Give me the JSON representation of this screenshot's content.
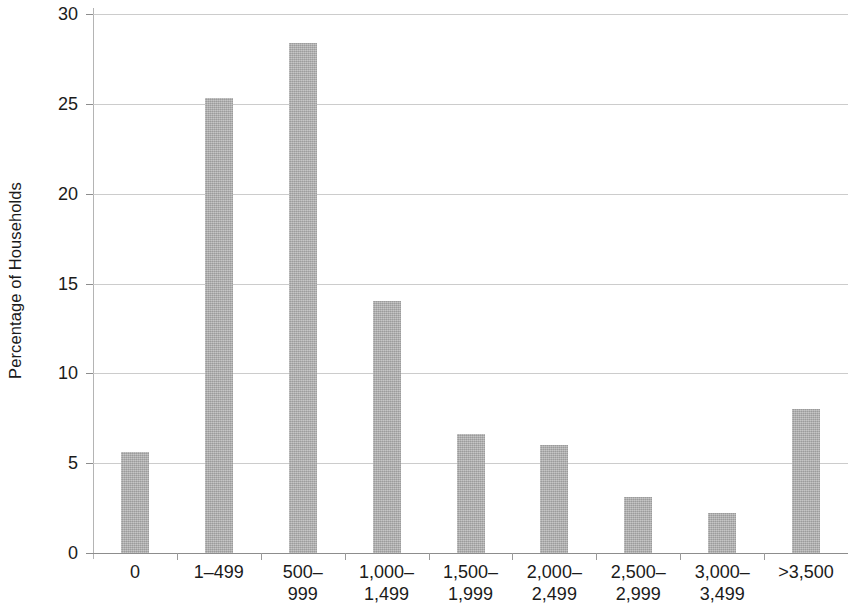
{
  "chart_data": {
    "type": "bar",
    "title": "",
    "subtitle": "",
    "xlabel": "",
    "ylabel": "Percentage of Households",
    "categories": [
      "0",
      "1–499",
      "500–\n999",
      "1,000–\n1,499",
      "1,500–\n1,999",
      "2,000–\n2,499",
      "2,500–\n2,999",
      "3,000–\n3,499",
      ">3,500"
    ],
    "values": [
      5.6,
      25.3,
      28.4,
      14.0,
      6.6,
      6.0,
      3.1,
      2.2,
      8.0
    ],
    "ylim": [
      0,
      30
    ],
    "ytick_labels": [
      "0",
      "5",
      "10",
      "15",
      "20",
      "25",
      "30"
    ],
    "ytick_values": [
      0,
      5,
      10,
      15,
      20,
      25,
      30
    ],
    "grid": true,
    "legend": "none",
    "bar_color": "#a9a9a9",
    "gridline_color": "#c9c9c9",
    "axis_color": "#8d8d8d",
    "background_color": "#ffffff",
    "text_color": "#1b1b1b"
  }
}
